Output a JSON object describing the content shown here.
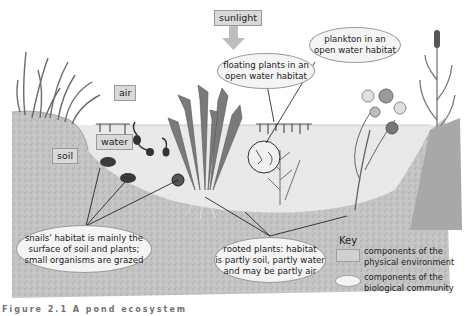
{
  "diagram": {
    "physical_labels": {
      "sunlight": "sunlight",
      "air": "air",
      "water": "water",
      "soil": "soil"
    },
    "community_labels": {
      "floating_plants": "floating plants in an\nopen water habitat",
      "plankton": "plankton in an\nopen water habitat",
      "snails": "snails' habitat is mainly the\nsurface of soil and plants;\nsmall organisms are grazed",
      "rooted_plants": "rooted plants: habitat\nis partly soil, partly water\nand may be partly air"
    },
    "key": {
      "title": "Key",
      "physical": "components of the\nphysical environment",
      "biological": "components of the\nbiological community"
    },
    "caption": "Figure 2.1 A pond ecosystem",
    "colors": {
      "label_box": "#d9d9d9",
      "ellipse_fill": "#f4f4f4",
      "soil": "#b8b8b8",
      "water": "#e6e6e6",
      "plant": "#6e6e6e",
      "arrow": "#bdbdbd"
    }
  }
}
